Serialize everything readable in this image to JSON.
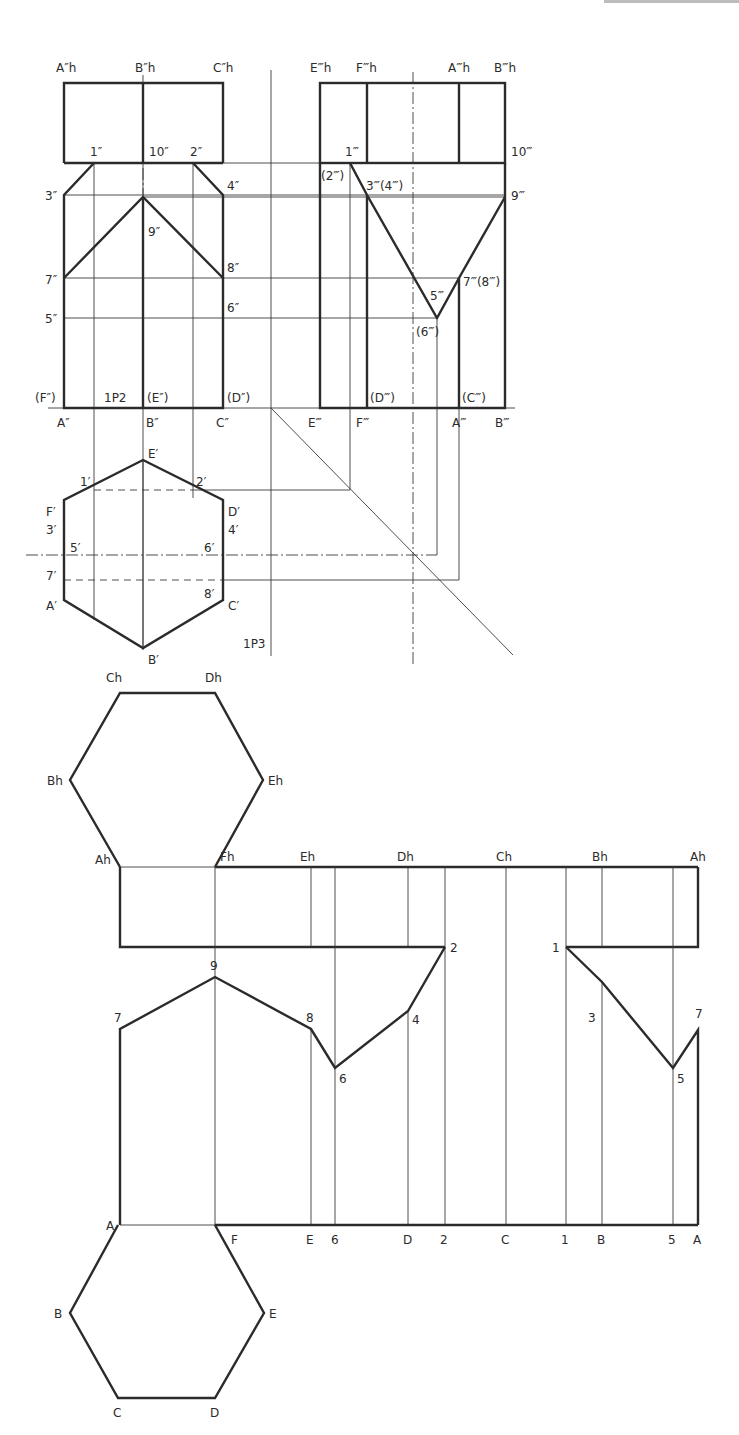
{
  "figure": {
    "views": {
      "front": {
        "labels": {
          "Ah": "A″h",
          "Bh": "B″h",
          "Ch": "C″h",
          "p1": "1″",
          "p10": "10″",
          "p2": "2″",
          "p3": "3″",
          "p4": "4″",
          "p9": "9″",
          "p7": "7″",
          "p8": "8″",
          "p5": "5″",
          "p6": "6″",
          "F": "(F″)",
          "plane": "1P2",
          "E": "(E″)",
          "D": "(D″)",
          "A": "A″",
          "B": "B″",
          "C": "C″"
        }
      },
      "side": {
        "labels": {
          "Eh": "E‴h",
          "Fh": "F‴h",
          "Ah": "A‴h",
          "Bh": "B‴h",
          "p1": "1‴",
          "p10": "10‴",
          "p2": "(2‴)",
          "p34": "3‴(4‴)",
          "p9": "9‴",
          "p78": "7‴(8‴)",
          "p5": "5‴",
          "p6": "(6‴)",
          "D": "(D‴)",
          "C": "(C‴)",
          "E": "E‴",
          "F": "F‴",
          "A": "A‴",
          "B": "B‴"
        }
      },
      "top": {
        "labels": {
          "E": "E′",
          "p1": "1′",
          "p2": "2′",
          "F": "F′",
          "p3": "3′",
          "D": "D′",
          "p4": "4′",
          "p5": "5′",
          "p6": "6′",
          "p7": "7′",
          "p8": "8′",
          "A": "A′",
          "C": "C′",
          "B": "B′",
          "plane": "1P3"
        }
      },
      "development": {
        "top_hexagon": {
          "Ch": "Ch",
          "Dh": "Dh",
          "Bh": "Bh",
          "Eh": "Eh",
          "Ah": "Ah",
          "Fh": "Fh"
        },
        "top_edge_labels": [
          "Eh",
          "Dh",
          "Ch",
          "Bh",
          "Ah"
        ],
        "profile_points": [
          "9",
          "7",
          "8",
          "6",
          "4",
          "2",
          "1",
          "3",
          "5",
          "7"
        ],
        "base_labels": [
          "A",
          "F",
          "E",
          "6",
          "D",
          "2",
          "C",
          "1",
          "B",
          "5",
          "A"
        ],
        "bottom_hexagon": {
          "B": "B",
          "C": "C",
          "D": "D",
          "E": "E"
        }
      }
    }
  }
}
